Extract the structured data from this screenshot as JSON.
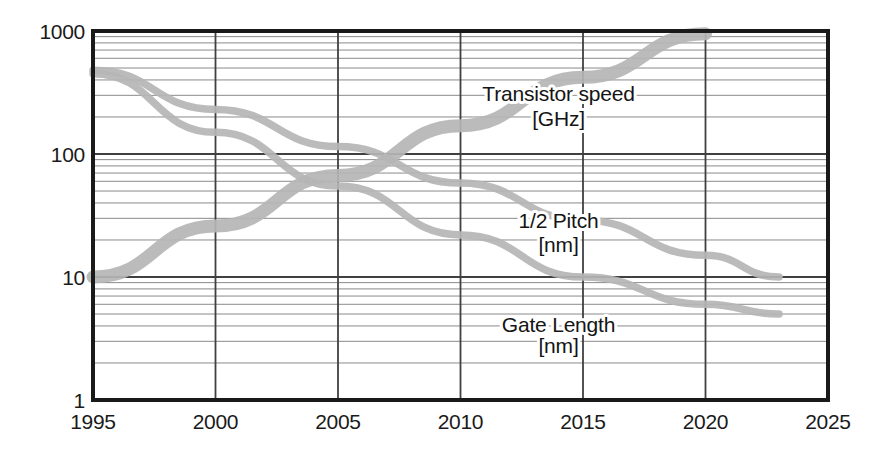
{
  "chart_data": {
    "type": "line",
    "title": "",
    "subtitle": "",
    "xlabel": "",
    "ylabel": "",
    "xlim": [
      1995,
      2025
    ],
    "ylim": [
      1,
      1000
    ],
    "yscale": "log",
    "xscale": "linear",
    "grid": true,
    "grid_minor": true,
    "legend_position": "inline-annotations",
    "x_ticks": [
      "1995",
      "2000",
      "2005",
      "2010",
      "2015",
      "2020",
      "2025"
    ],
    "x_tick_values": [
      1995,
      2000,
      2005,
      2010,
      2015,
      2020,
      2025
    ],
    "y_ticks": [
      "1000",
      "100",
      "10",
      "1"
    ],
    "y_tick_values": [
      1000,
      100,
      10,
      1
    ],
    "series": [
      {
        "name": "Transistor speed",
        "unit": "[GHz]",
        "label_line1": "Transistor speed",
        "label_line2": "[GHz]",
        "color": "#b5b5b5",
        "x": [
          1995,
          2000,
          2005,
          2010,
          2015,
          2020
        ],
        "values": [
          10,
          26,
          67,
          170,
          420,
          950
        ]
      },
      {
        "name": "1/2 Pitch",
        "unit": "[nm]",
        "label_line1": "1/2 Pitch",
        "label_line2": "[nm]",
        "color": "#b5b5b5",
        "x": [
          1995,
          2000,
          2005,
          2010,
          2015,
          2020,
          2023
        ],
        "values": [
          480,
          230,
          115,
          58,
          29,
          15,
          10
        ]
      },
      {
        "name": "Gate Length",
        "unit": "[nm]",
        "label_line1": "Gate Length",
        "label_line2": "[nm]",
        "color": "#b5b5b5",
        "x": [
          1995,
          2000,
          2005,
          2010,
          2015,
          2020,
          2023
        ],
        "values": [
          450,
          150,
          55,
          22,
          10,
          6,
          5
        ]
      }
    ],
    "annotations": [
      {
        "text": "Transistor speed",
        "x": 2014.0,
        "y": 270
      },
      {
        "text": "[GHz]",
        "x": 2014.0,
        "y": 170
      },
      {
        "text": "1/2 Pitch",
        "x": 2014.0,
        "y": 25
      },
      {
        "text": "[nm]",
        "x": 2014.0,
        "y": 16
      },
      {
        "text": "Gate Length",
        "x": 2014.0,
        "y": 3.6
      },
      {
        "text": "[nm]",
        "x": 2014.0,
        "y": 2.4
      }
    ],
    "colors": {
      "axis": "#1a1a1a",
      "grid_major": "#404040",
      "grid_minor": "#8a8a8a",
      "series_band": "#b5b5b5",
      "background": "#ffffff",
      "text": "#141414"
    }
  }
}
